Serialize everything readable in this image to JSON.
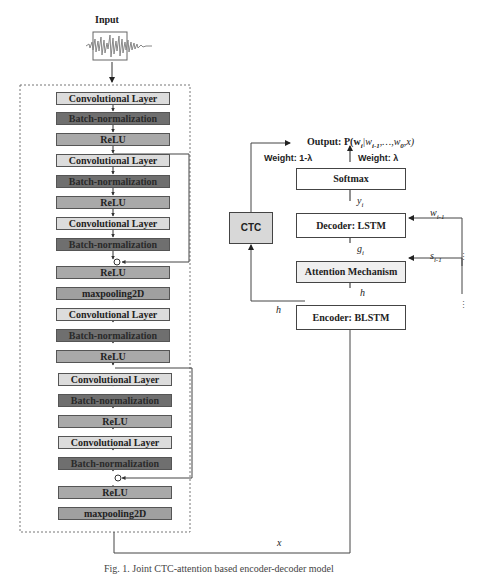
{
  "input": {
    "label": "Input",
    "icon": "audio-waveform-icon"
  },
  "cnn_stack": [
    {
      "label": "Convolutional Layer",
      "type": "conv"
    },
    {
      "label": "Batch-normalization",
      "type": "bn"
    },
    {
      "label": "ReLU",
      "type": "relu"
    },
    {
      "label": "Convolutional Layer",
      "type": "conv"
    },
    {
      "label": "Batch-normalization",
      "type": "bn"
    },
    {
      "label": "ReLU",
      "type": "relu"
    },
    {
      "label": "Convolutional Layer",
      "type": "conv"
    },
    {
      "label": "Batch-normalization",
      "type": "bn"
    },
    {
      "label": "ReLU",
      "type": "relu"
    },
    {
      "label": "maxpooling2D",
      "type": "pool"
    },
    {
      "label": "Convolutional Layer",
      "type": "conv"
    },
    {
      "label": "Batch-normalization",
      "type": "bn"
    },
    {
      "label": "ReLU",
      "type": "relu"
    },
    {
      "label": "Convolutional Layer",
      "type": "conv"
    },
    {
      "label": "Batch-normalization",
      "type": "bn"
    },
    {
      "label": "ReLU",
      "type": "relu"
    },
    {
      "label": "Convolutional Layer",
      "type": "conv"
    },
    {
      "label": "Batch-normalization",
      "type": "bn"
    },
    {
      "label": "ReLU",
      "type": "relu"
    },
    {
      "label": "maxpooling2D",
      "type": "pool"
    }
  ],
  "right": {
    "output_label": "Output: P(w",
    "output_full": "Output: P(w_i|w_{i-1},...,w_0,x)",
    "output_sub": "i",
    "output_rest": "|w",
    "output_sub2": "i-1",
    "output_tail": ",…,w",
    "output_sub3": "0",
    "output_end": ",x)",
    "weight_ctc": "Weight: 1-λ",
    "weight_att": "Weight: λ",
    "softmax": "Softmax",
    "decoder": "Decoder: LSTM",
    "attention": "Attention Mechanism",
    "encoder": "Encoder: BLSTM",
    "ctc": "CTC",
    "y_label": "y",
    "y_sub": "i",
    "g_label": "g",
    "g_sub": "i",
    "h_label": "h",
    "h_label2": "h",
    "w_label": "w",
    "w_sub": "i-1",
    "s_label": "s",
    "s_sub": "i-1",
    "x_label": "x",
    "ellipsis": "⋮"
  },
  "caption": "Fig. 1.  Joint CTC-attention based encoder-decoder model"
}
